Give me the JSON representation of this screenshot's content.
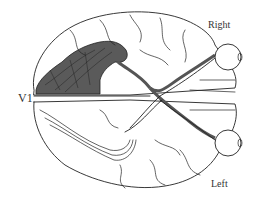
{
  "diagram": {
    "labels": {
      "right": "Right",
      "left": "Left",
      "v1": "V1"
    },
    "colors": {
      "shaded_region": "#5a5a5a",
      "line": "#222222",
      "background": "#ffffff"
    },
    "components": [
      "right-hemisphere",
      "left-hemisphere",
      "right-eye",
      "left-eye",
      "optic-nerves",
      "optic-chiasm",
      "optic-radiation-shaded",
      "primary-visual-cortex-v1"
    ]
  }
}
